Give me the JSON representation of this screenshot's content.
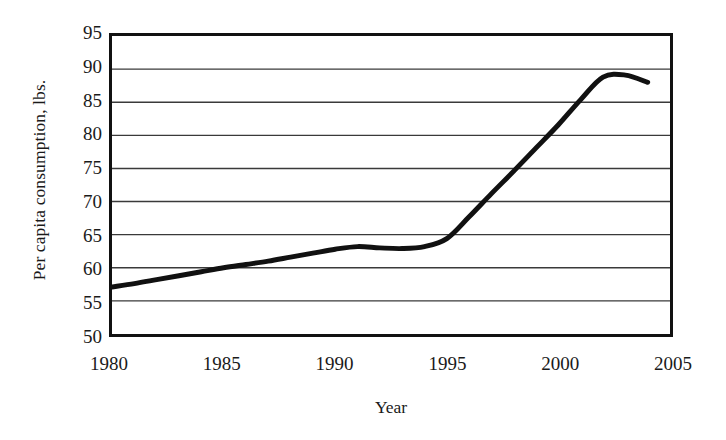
{
  "chart_data": {
    "type": "line",
    "title": "",
    "xlabel": "Year",
    "ylabel": "Per capita consumption, lbs.",
    "xlim": [
      1980,
      2005
    ],
    "ylim": [
      50,
      95
    ],
    "xticks": [
      1980,
      1985,
      1990,
      1995,
      2000,
      2005
    ],
    "xtick_labels": [
      "1980",
      "1985",
      "1990",
      "1995",
      "2000",
      "2005"
    ],
    "yticks": [
      50,
      55,
      60,
      65,
      70,
      75,
      80,
      85,
      90,
      95
    ],
    "ytick_labels": [
      "50",
      "55",
      "60",
      "65",
      "70",
      "75",
      "80",
      "85",
      "90",
      "95"
    ],
    "grid": "horizontal",
    "legend": "none",
    "line_color": "#111111",
    "line_width_px": 5,
    "series": [
      {
        "name": "Per capita consumption",
        "x": [
          1980,
          1981,
          1982,
          1983,
          1984,
          1985,
          1986,
          1987,
          1988,
          1989,
          1990,
          1991,
          1992,
          1993,
          1994,
          1995,
          1996,
          1997,
          1998,
          1999,
          2000,
          2001,
          2002,
          2003,
          2004
        ],
        "values": [
          57.1,
          57.6,
          58.2,
          58.8,
          59.4,
          60.0,
          60.5,
          61.0,
          61.6,
          62.2,
          62.8,
          63.2,
          63.0,
          62.9,
          63.2,
          64.4,
          67.7,
          71.2,
          74.6,
          78.1,
          81.6,
          85.4,
          88.8,
          89.1,
          88.0
        ]
      }
    ]
  },
  "axis": {
    "y_title": "Per capita consumption, lbs.",
    "x_title": "Year"
  }
}
